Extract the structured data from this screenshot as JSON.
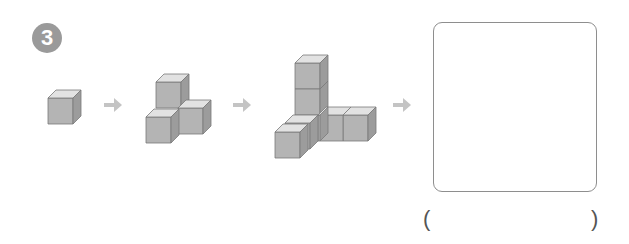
{
  "problem": {
    "number": "3",
    "badge_color": "#9a9a9a"
  },
  "sequence": [
    {
      "step": 1,
      "cube_count": 1
    },
    {
      "step": 2,
      "cube_count": 3
    },
    {
      "step": 3,
      "cube_count": 6
    },
    {
      "step": 4,
      "cube_count": null
    }
  ],
  "arrows": [
    "arrow-icon",
    "arrow-icon",
    "arrow-icon"
  ],
  "answer": {
    "open_paren": "(",
    "close_paren": ")",
    "value": ""
  },
  "colors": {
    "cube_front": "#b4b4b4",
    "cube_top": "#e2e2e2",
    "cube_side": "#9c9c9c",
    "cube_edge": "#7a7a7a",
    "arrow": "#c4c4c4",
    "box_border": "#8e8e8e"
  }
}
